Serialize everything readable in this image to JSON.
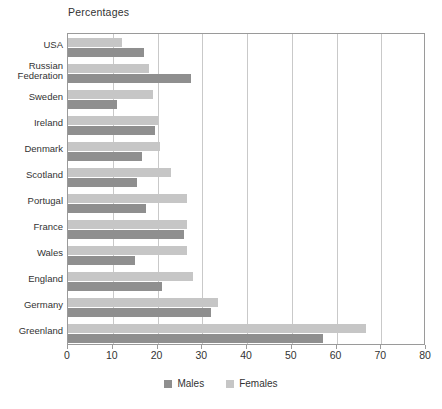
{
  "chart_data": {
    "type": "bar",
    "orientation": "horizontal",
    "title": "Percentages",
    "xlabel": "",
    "ylabel": "",
    "xlim": [
      0,
      80
    ],
    "xticks": [
      0,
      10,
      20,
      30,
      40,
      50,
      60,
      70,
      80
    ],
    "grid": true,
    "legend_position": "bottom",
    "categories": [
      "USA",
      "Russian\nFederation",
      "Sweden",
      "Ireland",
      "Denmark",
      "Scotland",
      "Portugal",
      "France",
      "Wales",
      "England",
      "Germany",
      "Greenland"
    ],
    "series": [
      {
        "name": "Males",
        "color": "#8f8f8f",
        "values": [
          17.0,
          27.5,
          11.0,
          19.5,
          16.5,
          15.5,
          17.5,
          26.0,
          15.0,
          21.0,
          32.0,
          57.0
        ]
      },
      {
        "name": "Females",
        "color": "#c6c6c6",
        "values": [
          12.1,
          18.0,
          19.0,
          20.0,
          20.5,
          23.0,
          26.5,
          26.5,
          26.5,
          28.0,
          33.5,
          66.5
        ]
      }
    ]
  },
  "legend": {
    "items": [
      {
        "label": "Males",
        "color": "#8f8f8f"
      },
      {
        "label": "Females",
        "color": "#c6c6c6"
      }
    ]
  }
}
